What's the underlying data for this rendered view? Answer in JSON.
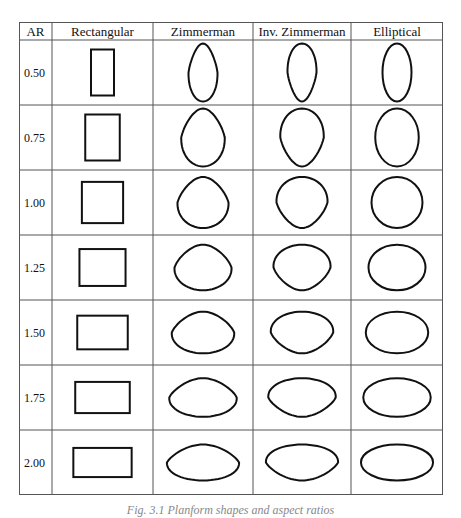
{
  "table": {
    "headers": [
      "AR",
      "Rectangular",
      "Zimmerman",
      "Inv. Zimmerman",
      "Elliptical"
    ],
    "rows": [
      {
        "ar": "0.50",
        "value": 0.5
      },
      {
        "ar": "0.75",
        "value": 0.75
      },
      {
        "ar": "1.00",
        "value": 1.0
      },
      {
        "ar": "1.25",
        "value": 1.25
      },
      {
        "ar": "1.50",
        "value": 1.5
      },
      {
        "ar": "1.75",
        "value": 1.75
      },
      {
        "ar": "2.00",
        "value": 2.0
      }
    ],
    "shape_types": [
      "rectangular",
      "zimmerman",
      "inv-zimmerman",
      "elliptical"
    ]
  },
  "caption": "Fig. 3.1 Planform shapes and aspect ratios"
}
